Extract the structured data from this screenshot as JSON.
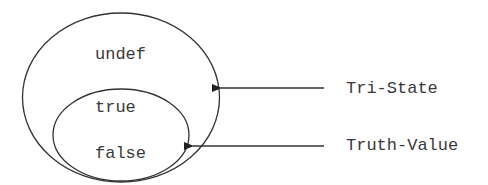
{
  "diagram": {
    "outer_set": {
      "label": "undef"
    },
    "inner_set": {
      "values": [
        "true",
        "false"
      ]
    },
    "annotations": [
      {
        "label": "Tri-State",
        "points_to": "outer ellipse"
      },
      {
        "label": "Truth-Value",
        "points_to": "inner ellipse"
      }
    ],
    "colors": {
      "stroke": "#333333",
      "text": "#3a3a3a",
      "background": "#ffffff"
    }
  }
}
